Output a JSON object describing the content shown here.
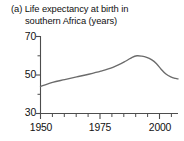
{
  "figure": {
    "panel_label": "(a)",
    "title_line1": "(a) Life expectancy at birth in",
    "title_line2": "southern Africa (years)"
  },
  "axis": {
    "y_ticks": [
      "70",
      "50",
      "30"
    ],
    "x_ticks": [
      "1950",
      "1975",
      "2000"
    ]
  },
  "colors": {
    "line": "#6b6b6b",
    "axis": "#4d4d4d",
    "text": "#111111",
    "background": "#ffffff"
  },
  "chart_data": {
    "type": "line",
    "title": "(a) Life expectancy at birth in southern Africa (years)",
    "xlabel": "",
    "ylabel": "years",
    "xlim": [
      1950,
      2007
    ],
    "ylim": [
      30,
      70
    ],
    "xticks": [
      1950,
      1975,
      2000
    ],
    "yticks": [
      30,
      50,
      70
    ],
    "xminortick_step": 5,
    "yminortick_step": 10,
    "grid": false,
    "legend": false,
    "series": [
      {
        "name": "Life expectancy at birth, southern Africa",
        "x": [
          1950,
          1955,
          1960,
          1965,
          1970,
          1975,
          1980,
          1985,
          1988,
          1990,
          1992,
          1994,
          1996,
          1998,
          2000,
          2002,
          2004,
          2006,
          2007
        ],
        "values": [
          44.0,
          46.2,
          47.6,
          49.0,
          50.4,
          52.0,
          54.0,
          57.0,
          59.2,
          60.0,
          59.8,
          59.2,
          58.0,
          56.0,
          53.0,
          50.5,
          49.0,
          48.2,
          48.0
        ]
      }
    ],
    "annotations": []
  }
}
